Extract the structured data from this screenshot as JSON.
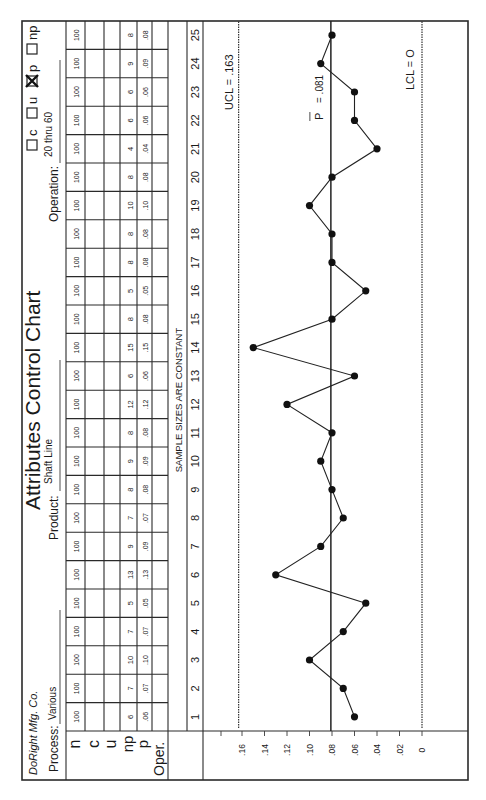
{
  "form": {
    "company": "DoRight Mfg. Co.",
    "title": "Attributes Control Chart",
    "process_label": "Process:",
    "process_value": "Various",
    "product_label": "Product:",
    "product_value": "Shaft Line",
    "operation_label": "Operation:",
    "operation_value": "20 thru 60",
    "chart_types": [
      {
        "label": "c",
        "checked": false
      },
      {
        "label": "u",
        "checked": false
      },
      {
        "label": "p",
        "checked": true
      },
      {
        "label": "np",
        "checked": false
      }
    ],
    "row_labels": [
      "n",
      "c",
      "u",
      "np",
      "p",
      "Oper."
    ],
    "sample_note": "SAMPLE SIZES ARE CONSTANT",
    "figure_caption_partial": "FIGURE 10.1"
  },
  "table": {
    "samples": [
      1,
      2,
      3,
      4,
      5,
      6,
      7,
      8,
      9,
      10,
      11,
      12,
      13,
      14,
      15,
      16,
      17,
      18,
      19,
      20,
      21,
      22,
      23,
      24,
      25
    ],
    "n": [
      "100",
      "100",
      "100",
      "100",
      "100",
      "100",
      "100",
      "100",
      "100",
      "100",
      "100",
      "100",
      "100",
      "100",
      "100",
      "100",
      "100",
      "100",
      "100",
      "100",
      "100",
      "100",
      "100",
      "100",
      "100"
    ],
    "np": [
      "6",
      "7",
      "10",
      "7",
      "5",
      "13",
      "9",
      "7",
      "8",
      "9",
      "8",
      "12",
      "6",
      "15",
      "8",
      "5",
      "8",
      "8",
      "10",
      "8",
      "4",
      "6",
      "6",
      "9",
      "8"
    ],
    "p": [
      ".06",
      ".07",
      ".10",
      ".07",
      ".05",
      ".13",
      ".09",
      ".07",
      ".08",
      ".09",
      ".08",
      ".12",
      ".06",
      ".15",
      ".08",
      ".05",
      ".08",
      ".08",
      ".10",
      ".08",
      ".04",
      ".06",
      ".06",
      ".09",
      ".08"
    ]
  },
  "chart_data": {
    "type": "line",
    "xlabel": "Sample",
    "ylabel": "p (fraction defective)",
    "x": [
      1,
      2,
      3,
      4,
      5,
      6,
      7,
      8,
      9,
      10,
      11,
      12,
      13,
      14,
      15,
      16,
      17,
      18,
      19,
      20,
      21,
      22,
      23,
      24,
      25
    ],
    "series": [
      {
        "name": "p",
        "values": [
          0.06,
          0.07,
          0.1,
          0.07,
          0.05,
          0.13,
          0.09,
          0.07,
          0.08,
          0.09,
          0.08,
          0.12,
          0.06,
          0.15,
          0.08,
          0.05,
          0.08,
          0.08,
          0.1,
          0.08,
          0.04,
          0.06,
          0.06,
          0.09,
          0.08
        ]
      }
    ],
    "yticks": [
      ".16",
      ".14",
      ".12",
      ".10",
      ".08",
      ".06",
      ".04",
      ".02",
      "0"
    ],
    "ylim": [
      0,
      0.18
    ],
    "control_limits": {
      "ucl": 0.163,
      "ucl_label": "UCL = .163",
      "center": 0.081,
      "center_label": "P",
      "center_value_label": "= .081",
      "lcl": 0,
      "lcl_label": "LCL = O"
    },
    "grid": false,
    "legend": "none"
  }
}
